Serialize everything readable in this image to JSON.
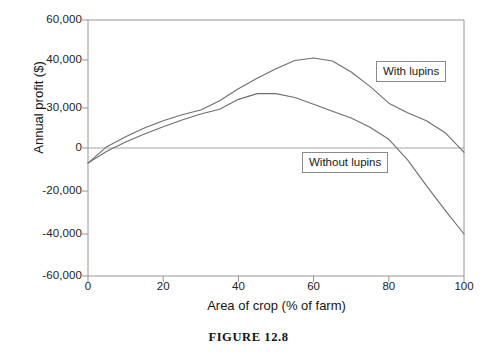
{
  "caption": "FIGURE 12.8",
  "chart_data": {
    "type": "line",
    "title": "",
    "xlabel": "Area of crop (% of farm)",
    "ylabel": "Annual profit ($)",
    "xlim": [
      0,
      100
    ],
    "ylim": [
      -60000,
      60000
    ],
    "xticks": [
      "0",
      "20",
      "40",
      "60",
      "80",
      "100"
    ],
    "xtick_values": [
      0,
      20,
      40,
      60,
      80,
      100
    ],
    "yticks": [
      "60,000",
      "40,000",
      "30,000",
      "0",
      "-20,000",
      "-40,000",
      "-60,000"
    ],
    "ytick_values": [
      60000,
      40000,
      30000,
      0,
      -20000,
      -40000,
      -60000
    ],
    "grid": false,
    "legend_position": "inline-callouts",
    "zero_line": true,
    "series": [
      {
        "name": "With lupins",
        "label": "With lupins",
        "color": "#6e6e6e",
        "x": [
          0,
          5,
          10,
          15,
          20,
          25,
          30,
          35,
          40,
          45,
          50,
          55,
          60,
          65,
          70,
          75,
          80,
          85,
          90,
          95,
          100
        ],
        "values": [
          -7000,
          1000,
          8500,
          15000,
          20500,
          25000,
          28500,
          31500,
          34000,
          36200,
          38200,
          39900,
          41000,
          39800,
          37500,
          34500,
          31000,
          26500,
          20500,
          11500,
          -2000
        ]
      },
      {
        "name": "Without lupins",
        "label": "Without lupins",
        "color": "#6e6e6e",
        "x": [
          0,
          5,
          10,
          15,
          20,
          25,
          30,
          35,
          40,
          45,
          50,
          55,
          60,
          65,
          70,
          75,
          80,
          85,
          90,
          95,
          100
        ],
        "values": [
          -7000,
          -1500,
          4500,
          10500,
          16000,
          21000,
          25500,
          29000,
          31800,
          33000,
          33000,
          32200,
          30800,
          27500,
          22500,
          15500,
          6500,
          -5500,
          -17500,
          -29000,
          -40000
        ]
      }
    ],
    "annotations": [
      {
        "text": "With lupins",
        "series": "With lupins"
      },
      {
        "text": "Without lupins",
        "series": "Without lupins"
      }
    ]
  },
  "axis": {
    "line_color": "#8a8a8a",
    "zero_line_color": "#9a9a9a"
  }
}
